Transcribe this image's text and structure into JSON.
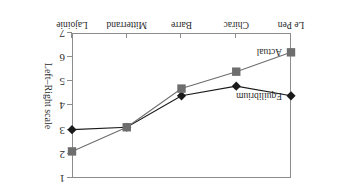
{
  "chart_data": {
    "type": "line",
    "title": "",
    "xlabel": "",
    "ylabel": "Left–Right scale",
    "categories": [
      "Lajoinie",
      "Mitterrand",
      "Barre",
      "Chirac",
      "Le Pen"
    ],
    "yticks": [
      "1",
      "2",
      "3",
      "4",
      "5",
      "6",
      "7"
    ],
    "ylim": [
      1,
      7
    ],
    "y_axis_inverted": true,
    "grid": false,
    "legend": "in-plot annotations",
    "orientation": "figure rendered upside-down (rotated 180°)",
    "series": [
      {
        "name": "Equilibrium",
        "marker": "diamond",
        "color": "#1a1a1a",
        "values": [
          3.0,
          3.1,
          4.4,
          4.8,
          4.4
        ]
      },
      {
        "name": "Actual",
        "marker": "square",
        "color": "#6e6e6e",
        "values": [
          2.1,
          3.1,
          4.7,
          5.4,
          6.2
        ]
      }
    ],
    "annotations": [
      {
        "text": "Equilibrium",
        "series": "Equilibrium",
        "at_category": "Le Pen"
      },
      {
        "text": "Actual",
        "series": "Actual",
        "at_category": "Le Pen"
      }
    ]
  },
  "colors": {
    "equilibrium": "#1a1a1a",
    "actual": "#6e6e6e",
    "axis": "#8c8c8c",
    "background": "#ffffff",
    "text": "#2b2b2b"
  }
}
